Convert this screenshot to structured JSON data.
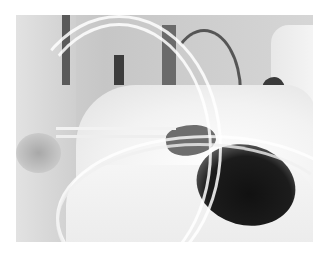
{
  "image": {
    "description": "Grayscale photograph of a patient lying in a hospital bed covered with white sheets, wearing a mask, with several transparent tubes running across the bed; medical staff in white coats stand on both sides.",
    "colors": {
      "background": "#ffffff",
      "sheet": "#f2f2f2",
      "hair": "#111111",
      "wall": "#cdcdcd"
    },
    "bounds": {
      "left": 16,
      "top": 15,
      "width": 297,
      "height": 227
    }
  }
}
